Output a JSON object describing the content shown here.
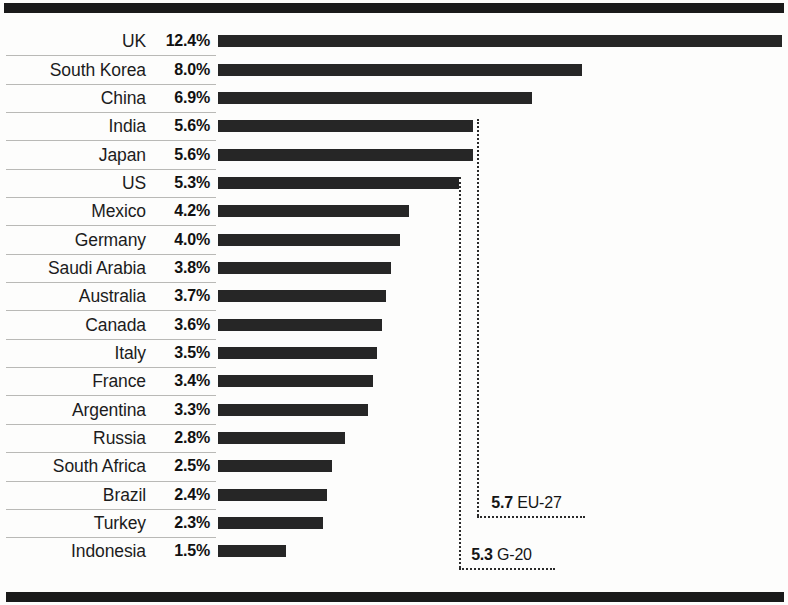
{
  "chart_data": {
    "type": "bar",
    "orientation": "horizontal",
    "title": "",
    "subtitle": "",
    "xlabel": "",
    "ylabel": "",
    "xlim": [
      0,
      12.4
    ],
    "grid": false,
    "legend": null,
    "value_suffix": "%",
    "categories": [
      "UK",
      "South Korea",
      "China",
      "India",
      "Japan",
      "US",
      "Mexico",
      "Germany",
      "Saudi Arabia",
      "Australia",
      "Canada",
      "Italy",
      "France",
      "Argentina",
      "Russia",
      "South Africa",
      "Brazil",
      "Turkey",
      "Indonesia"
    ],
    "values": [
      12.4,
      8.0,
      6.9,
      5.6,
      5.6,
      5.3,
      4.2,
      4.0,
      3.8,
      3.7,
      3.6,
      3.5,
      3.4,
      3.3,
      2.8,
      2.5,
      2.4,
      2.3,
      1.5
    ],
    "value_labels": [
      "12.4%",
      "8.0%",
      "6.9%",
      "5.6%",
      "5.6%",
      "5.3%",
      "4.2%",
      "4.0%",
      "3.8%",
      "3.7%",
      "3.6%",
      "3.5%",
      "3.4%",
      "3.3%",
      "2.8%",
      "2.5%",
      "2.4%",
      "2.3%",
      "1.5%"
    ],
    "annotations": [
      {
        "name": "eu-27-reference",
        "value": 5.7,
        "value_label": "5.7",
        "label": "EU-27"
      },
      {
        "name": "g-20-reference",
        "value": 5.3,
        "value_label": "5.3",
        "label": "G-20"
      }
    ],
    "colors": {
      "bar": "#262626",
      "background": "#fdfdfc",
      "rule": "#1a1a1a",
      "separator": "#b9b9b6",
      "reference_line": "#2a2a2a"
    }
  },
  "rows": [
    {
      "country": "UK",
      "pct": "12.4%",
      "value": 12.4
    },
    {
      "country": "South Korea",
      "pct": "8.0%",
      "value": 8.0
    },
    {
      "country": "China",
      "pct": "6.9%",
      "value": 6.9
    },
    {
      "country": "India",
      "pct": "5.6%",
      "value": 5.6
    },
    {
      "country": "Japan",
      "pct": "5.6%",
      "value": 5.6
    },
    {
      "country": "US",
      "pct": "5.3%",
      "value": 5.3
    },
    {
      "country": "Mexico",
      "pct": "4.2%",
      "value": 4.2
    },
    {
      "country": "Germany",
      "pct": "4.0%",
      "value": 4.0
    },
    {
      "country": "Saudi Arabia",
      "pct": "3.8%",
      "value": 3.8
    },
    {
      "country": "Australia",
      "pct": "3.7%",
      "value": 3.7
    },
    {
      "country": "Canada",
      "pct": "3.6%",
      "value": 3.6
    },
    {
      "country": "Italy",
      "pct": "3.5%",
      "value": 3.5
    },
    {
      "country": "France",
      "pct": "3.4%",
      "value": 3.4
    },
    {
      "country": "Argentina",
      "pct": "3.3%",
      "value": 3.3
    },
    {
      "country": "Russia",
      "pct": "2.8%",
      "value": 2.8
    },
    {
      "country": "South Africa",
      "pct": "2.5%",
      "value": 2.5
    },
    {
      "country": "Brazil",
      "pct": "2.4%",
      "value": 2.4
    },
    {
      "country": "Turkey",
      "pct": "2.3%",
      "value": 2.3
    },
    {
      "country": "Indonesia",
      "pct": "1.5%",
      "value": 1.5
    }
  ],
  "references": {
    "eu27": {
      "value_label": "5.7",
      "label": "EU-27",
      "value": 5.7
    },
    "g20": {
      "value_label": "5.3",
      "label": "G-20",
      "value": 5.3
    }
  }
}
